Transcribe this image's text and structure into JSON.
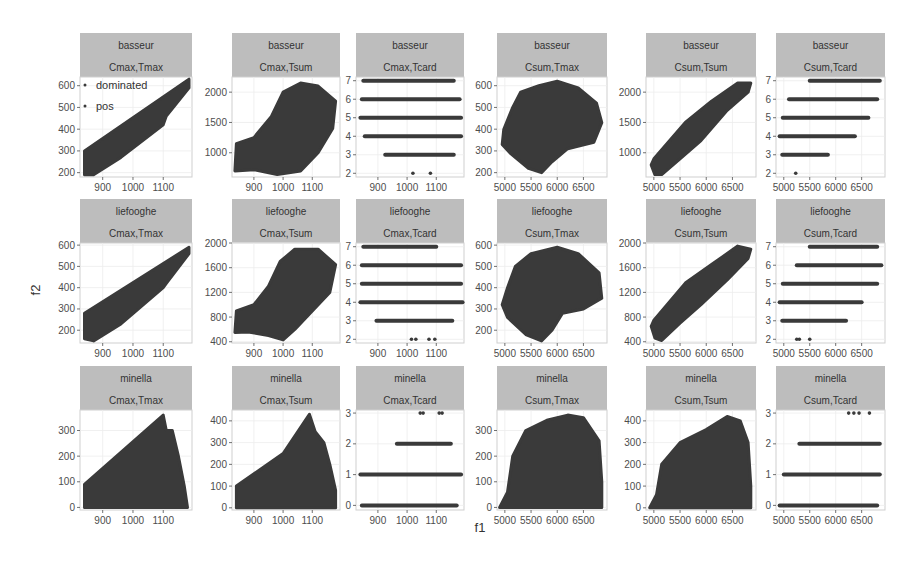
{
  "chart_data": {
    "type": "scatter",
    "title": "",
    "xlabel": "f1",
    "ylabel": "f2",
    "point_color": "#3a3a3a",
    "strip_color": "#bdbdbd",
    "legend": {
      "position": "inside top-left of first panel",
      "entries": [
        "dominated",
        "pos"
      ]
    },
    "rows": [
      "basseur",
      "liefooghe",
      "minella"
    ],
    "columns": [
      "Cmax,Tmax",
      "Cmax,Tsum",
      "Cmax,Tcard",
      "Csum,Tmax",
      "Csum,Tsum",
      "Csum,Tcard"
    ],
    "x_axes": {
      "Cmax": {
        "ticks": [
          900,
          1000,
          1100
        ],
        "range": [
          825,
          1195
        ]
      },
      "Csum": {
        "ticks": [
          5000,
          5500,
          6000,
          6500
        ],
        "range": [
          4850,
          6950
        ]
      }
    },
    "panels": [
      {
        "row": "basseur",
        "col": "Cmax,Tmax",
        "shape": "band",
        "yticks": [
          200,
          300,
          400,
          500,
          600
        ],
        "yrange": [
          180,
          640
        ],
        "band": [
          [
            840,
            190
          ],
          [
            840,
            300
          ],
          [
            1185,
            630
          ],
          [
            1185,
            590
          ],
          [
            1110,
            460
          ],
          [
            1100,
            420
          ],
          [
            960,
            270
          ],
          [
            870,
            190
          ]
        ]
      },
      {
        "row": "basseur",
        "col": "Cmax,Tsum",
        "shape": "blob",
        "yticks": [
          1000,
          1500,
          2000
        ],
        "yrange": [
          600,
          2250
        ],
        "blob": [
          [
            835,
            700
          ],
          [
            840,
            1150
          ],
          [
            900,
            1250
          ],
          [
            960,
            1600
          ],
          [
            1000,
            2000
          ],
          [
            1060,
            2150
          ],
          [
            1120,
            2100
          ],
          [
            1180,
            1850
          ],
          [
            1170,
            1400
          ],
          [
            1120,
            1000
          ],
          [
            1060,
            700
          ],
          [
            980,
            640
          ],
          [
            900,
            720
          ]
        ]
      },
      {
        "row": "basseur",
        "col": "Cmax,Tcard",
        "shape": "levels",
        "yticks": [
          2,
          3,
          4,
          5,
          6,
          7
        ],
        "yrange": [
          1.8,
          7.2
        ],
        "levels": [
          {
            "y": 7,
            "x0": 850,
            "x1": 1160
          },
          {
            "y": 6,
            "x0": 845,
            "x1": 1180
          },
          {
            "y": 5,
            "x0": 840,
            "x1": 1185
          },
          {
            "y": 4,
            "x0": 855,
            "x1": 1185
          },
          {
            "y": 3,
            "x0": 925,
            "x1": 1160
          }
        ],
        "isolated": [
          {
            "x": 1020,
            "y": 2
          },
          {
            "x": 1080,
            "y": 2
          }
        ]
      },
      {
        "row": "basseur",
        "col": "Csum,Tmax",
        "shape": "blob",
        "yticks": [
          200,
          300,
          400,
          500,
          600
        ],
        "yrange": [
          180,
          640
        ],
        "blob": [
          [
            4950,
            330
          ],
          [
            4980,
            400
          ],
          [
            5150,
            500
          ],
          [
            5300,
            570
          ],
          [
            5650,
            600
          ],
          [
            6000,
            620
          ],
          [
            6400,
            590
          ],
          [
            6750,
            520
          ],
          [
            6850,
            430
          ],
          [
            6700,
            340
          ],
          [
            6200,
            310
          ],
          [
            5900,
            250
          ],
          [
            5700,
            200
          ],
          [
            5450,
            220
          ],
          [
            5100,
            290
          ]
        ]
      },
      {
        "row": "basseur",
        "col": "Csum,Tsum",
        "shape": "band",
        "yticks": [
          1000,
          1500,
          2000
        ],
        "yrange": [
          600,
          2250
        ],
        "band": [
          [
            4950,
            800
          ],
          [
            5000,
            900
          ],
          [
            5600,
            1500
          ],
          [
            6100,
            1850
          ],
          [
            6600,
            2150
          ],
          [
            6850,
            2150
          ],
          [
            6800,
            2000
          ],
          [
            6400,
            1700
          ],
          [
            5900,
            1200
          ],
          [
            5500,
            900
          ],
          [
            5150,
            640
          ],
          [
            5020,
            640
          ]
        ]
      },
      {
        "row": "basseur",
        "col": "Csum,Tcard",
        "shape": "levels",
        "yticks": [
          2,
          3,
          4,
          5,
          6,
          7
        ],
        "yrange": [
          1.8,
          7.2
        ],
        "levels": [
          {
            "y": 7,
            "x0": 5500,
            "x1": 6850
          },
          {
            "y": 6,
            "x0": 5100,
            "x1": 6800
          },
          {
            "y": 5,
            "x0": 4980,
            "x1": 6630
          },
          {
            "y": 4,
            "x0": 4920,
            "x1": 6370
          },
          {
            "y": 3,
            "x0": 4970,
            "x1": 5850
          }
        ],
        "isolated": [
          {
            "x": 5230,
            "y": 2
          }
        ]
      },
      {
        "row": "liefooghe",
        "col": "Cmax,Tmax",
        "shape": "band",
        "yticks": [
          200,
          300,
          400,
          500,
          600
        ],
        "yrange": [
          140,
          610
        ],
        "band": [
          [
            840,
            160
          ],
          [
            840,
            280
          ],
          [
            1185,
            590
          ],
          [
            1185,
            560
          ],
          [
            1110,
            420
          ],
          [
            1100,
            400
          ],
          [
            960,
            230
          ],
          [
            870,
            150
          ]
        ]
      },
      {
        "row": "liefooghe",
        "col": "Cmax,Tsum",
        "shape": "blob",
        "yticks": [
          400,
          800,
          1200,
          1600,
          2000
        ],
        "yrange": [
          380,
          2000
        ],
        "blob": [
          [
            835,
            550
          ],
          [
            840,
            900
          ],
          [
            900,
            1000
          ],
          [
            950,
            1300
          ],
          [
            990,
            1700
          ],
          [
            1040,
            1900
          ],
          [
            1120,
            1900
          ],
          [
            1180,
            1650
          ],
          [
            1160,
            1200
          ],
          [
            1100,
            900
          ],
          [
            1040,
            600
          ],
          [
            1000,
            430
          ],
          [
            950,
            500
          ],
          [
            880,
            560
          ]
        ]
      },
      {
        "row": "liefooghe",
        "col": "Cmax,Tcard",
        "shape": "levels",
        "yticks": [
          2,
          3,
          4,
          5,
          6,
          7
        ],
        "yrange": [
          1.8,
          7.2
        ],
        "levels": [
          {
            "y": 7,
            "x0": 850,
            "x1": 1100
          },
          {
            "y": 6,
            "x0": 845,
            "x1": 1185
          },
          {
            "y": 5,
            "x0": 845,
            "x1": 1185
          },
          {
            "y": 4,
            "x0": 840,
            "x1": 1190
          },
          {
            "y": 3,
            "x0": 895,
            "x1": 1155
          }
        ],
        "isolated": [
          {
            "x": 1015,
            "y": 2
          },
          {
            "x": 1030,
            "y": 2
          },
          {
            "x": 1075,
            "y": 2
          },
          {
            "x": 1095,
            "y": 2
          }
        ]
      },
      {
        "row": "liefooghe",
        "col": "Csum,Tmax",
        "shape": "blob",
        "yticks": [
          200,
          300,
          400,
          500,
          600
        ],
        "yrange": [
          140,
          610
        ],
        "blob": [
          [
            4950,
            320
          ],
          [
            5050,
            400
          ],
          [
            5200,
            500
          ],
          [
            5500,
            560
          ],
          [
            6000,
            590
          ],
          [
            6400,
            560
          ],
          [
            6800,
            470
          ],
          [
            6850,
            350
          ],
          [
            6500,
            300
          ],
          [
            6100,
            280
          ],
          [
            5900,
            200
          ],
          [
            5700,
            150
          ],
          [
            5400,
            180
          ],
          [
            5050,
            260
          ]
        ]
      },
      {
        "row": "liefooghe",
        "col": "Csum,Tsum",
        "shape": "band",
        "yticks": [
          400,
          800,
          1200,
          1600,
          2000
        ],
        "yrange": [
          380,
          2000
        ],
        "band": [
          [
            4950,
            650
          ],
          [
            5000,
            750
          ],
          [
            5600,
            1350
          ],
          [
            6100,
            1650
          ],
          [
            6600,
            1950
          ],
          [
            6850,
            1900
          ],
          [
            6800,
            1750
          ],
          [
            6400,
            1400
          ],
          [
            5900,
            1000
          ],
          [
            5500,
            700
          ],
          [
            5150,
            420
          ],
          [
            5020,
            460
          ]
        ]
      },
      {
        "row": "liefooghe",
        "col": "Csum,Tcard",
        "shape": "levels",
        "yticks": [
          2,
          3,
          4,
          5,
          6,
          7
        ],
        "yrange": [
          1.8,
          7.2
        ],
        "levels": [
          {
            "y": 7,
            "x0": 5500,
            "x1": 6800
          },
          {
            "y": 6,
            "x0": 5250,
            "x1": 6880
          },
          {
            "y": 5,
            "x0": 4980,
            "x1": 6800
          },
          {
            "y": 4,
            "x0": 4920,
            "x1": 6500
          },
          {
            "y": 3,
            "x0": 4970,
            "x1": 6200
          }
        ],
        "isolated": [
          {
            "x": 5250,
            "y": 2
          },
          {
            "x": 5300,
            "y": 2
          },
          {
            "x": 5500,
            "y": 2
          }
        ]
      },
      {
        "row": "minella",
        "col": "Cmax,Tmax",
        "shape": "wedge",
        "yticks": [
          0,
          100,
          200,
          300
        ],
        "yrange": [
          -10,
          380
        ],
        "wedge": [
          [
            840,
            0
          ],
          [
            840,
            90
          ],
          [
            1100,
            360
          ],
          [
            1110,
            300
          ],
          [
            1130,
            300
          ],
          [
            1150,
            200
          ],
          [
            1170,
            80
          ],
          [
            1180,
            0
          ]
        ]
      },
      {
        "row": "minella",
        "col": "Cmax,Tsum",
        "shape": "wedge",
        "yticks": [
          0,
          100,
          200,
          300,
          400
        ],
        "yrange": [
          -10,
          450
        ],
        "wedge": [
          [
            840,
            0
          ],
          [
            840,
            100
          ],
          [
            1000,
            250
          ],
          [
            1090,
            430
          ],
          [
            1110,
            350
          ],
          [
            1140,
            300
          ],
          [
            1160,
            200
          ],
          [
            1180,
            80
          ],
          [
            1180,
            0
          ]
        ]
      },
      {
        "row": "minella",
        "col": "Cmax,Tcard",
        "shape": "levels",
        "yticks": [
          0,
          1,
          2,
          3
        ],
        "yrange": [
          -0.15,
          3.1
        ],
        "levels": [
          {
            "y": 2,
            "x0": 965,
            "x1": 1150
          },
          {
            "y": 1,
            "x0": 840,
            "x1": 1185
          },
          {
            "y": 0,
            "x0": 845,
            "x1": 1170
          }
        ],
        "isolated": [
          {
            "x": 1045,
            "y": 3
          },
          {
            "x": 1055,
            "y": 3
          },
          {
            "x": 1110,
            "y": 3
          },
          {
            "x": 1120,
            "y": 3
          }
        ]
      },
      {
        "row": "minella",
        "col": "Csum,Tmax",
        "shape": "wedge",
        "yticks": [
          0,
          100,
          200,
          300
        ],
        "yrange": [
          -10,
          380
        ],
        "wedge": [
          [
            4900,
            0
          ],
          [
            5050,
            60
          ],
          [
            5150,
            200
          ],
          [
            5400,
            300
          ],
          [
            5800,
            340
          ],
          [
            6200,
            360
          ],
          [
            6500,
            350
          ],
          [
            6800,
            260
          ],
          [
            6850,
            100
          ],
          [
            6850,
            0
          ]
        ]
      },
      {
        "row": "minella",
        "col": "Csum,Tsum",
        "shape": "wedge",
        "yticks": [
          0,
          100,
          200,
          300,
          400
        ],
        "yrange": [
          -10,
          450
        ],
        "wedge": [
          [
            4920,
            0
          ],
          [
            5050,
            60
          ],
          [
            5150,
            200
          ],
          [
            5500,
            300
          ],
          [
            6000,
            360
          ],
          [
            6400,
            420
          ],
          [
            6650,
            400
          ],
          [
            6800,
            300
          ],
          [
            6850,
            100
          ],
          [
            6850,
            0
          ]
        ]
      },
      {
        "row": "minella",
        "col": "Csum,Tcard",
        "shape": "levels",
        "yticks": [
          0,
          1,
          2,
          3
        ],
        "yrange": [
          -0.15,
          3.1
        ],
        "levels": [
          {
            "y": 2,
            "x0": 5300,
            "x1": 6850
          },
          {
            "y": 1,
            "x0": 5000,
            "x1": 6850
          },
          {
            "y": 0,
            "x0": 4920,
            "x1": 6800
          }
        ],
        "isolated": [
          {
            "x": 6250,
            "y": 3
          },
          {
            "x": 6350,
            "y": 3
          },
          {
            "x": 6450,
            "y": 3
          },
          {
            "x": 6650,
            "y": 3
          }
        ]
      }
    ]
  },
  "layout": {
    "col_x": [
      [
        80,
        192
      ],
      [
        232,
        340
      ],
      [
        356,
        464
      ],
      [
        497,
        607
      ],
      [
        646,
        756
      ],
      [
        776,
        885
      ]
    ],
    "row_y": [
      [
        33,
        77,
        177
      ],
      [
        199,
        243,
        343
      ],
      [
        366,
        410,
        510
      ]
    ]
  }
}
